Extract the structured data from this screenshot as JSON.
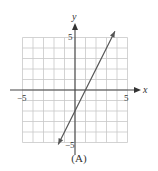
{
  "chart_data": {
    "type": "line",
    "title": "",
    "caption": "(A)",
    "xlabel": "x",
    "ylabel": "y",
    "xlim": [
      -5,
      5
    ],
    "ylim": [
      -5,
      5
    ],
    "grid": true,
    "x_tick_labels": [
      "−5",
      "5"
    ],
    "y_tick_labels": [
      "5",
      "−5"
    ],
    "series": [
      {
        "name": "line",
        "equation": "y = 2x - 2",
        "points": [
          [
            -1.6,
            -5.2
          ],
          [
            3.8,
            5.6
          ]
        ],
        "arrows": "both",
        "color": "#555555"
      }
    ]
  },
  "labels": {
    "x_axis": "x",
    "y_axis": "y",
    "x_min": "−5",
    "x_max": "5",
    "y_max": "5",
    "y_min": "−5",
    "caption": "(A)"
  }
}
